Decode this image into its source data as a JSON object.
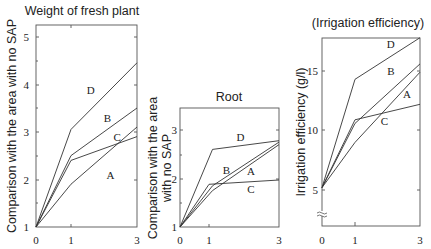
{
  "chart_data": [
    {
      "type": "line",
      "title": "Weight of fresh plant",
      "xlabel": "",
      "ylabel": "Comparison with the area with no SAP",
      "x": [
        0,
        1,
        3
      ],
      "x_ticks": [
        0,
        1,
        3
      ],
      "y_ticks": [
        1,
        2,
        3,
        4,
        5
      ],
      "ylim": [
        1,
        5.25
      ],
      "xlim": [
        0,
        3
      ],
      "grid": false,
      "legend": "inline labels",
      "series": [
        {
          "name": "A",
          "values": [
            1.0,
            1.9,
            3.1
          ],
          "label_pos": [
            2.2,
            2.0
          ]
        },
        {
          "name": "B",
          "values": [
            1.0,
            2.5,
            3.5
          ],
          "label_pos": [
            2.1,
            3.2
          ]
        },
        {
          "name": "C",
          "values": [
            1.0,
            2.4,
            2.9
          ],
          "label_pos": [
            2.4,
            2.8
          ]
        },
        {
          "name": "D",
          "values": [
            1.0,
            3.05,
            4.45
          ],
          "label_pos": [
            1.6,
            3.8
          ]
        }
      ]
    },
    {
      "type": "line",
      "title": "Root",
      "xlabel": "",
      "ylabel_lines": [
        "Comparison with the area",
        "with no SAP"
      ],
      "ylabel": "Comparison with the area with no SAP",
      "x": [
        0,
        1,
        3
      ],
      "x_ticks": [
        0,
        1,
        3
      ],
      "y_ticks": [
        1,
        2,
        3
      ],
      "ylim": [
        1,
        3.45
      ],
      "xlim": [
        0,
        3
      ],
      "grid": false,
      "legend": "inline labels",
      "series": [
        {
          "name": "A",
          "values": [
            1.0,
            1.88,
            1.97
          ],
          "label_pos": [
            2.2,
            2.08
          ],
          "x": [
            0,
            1,
            3
          ]
        },
        {
          "name": "B",
          "values": [
            1.0,
            1.85,
            2.75
          ],
          "label_pos": [
            1.5,
            2.1
          ],
          "x": [
            0,
            1.1,
            3
          ]
        },
        {
          "name": "C",
          "values": [
            1.0,
            1.75,
            2.7
          ],
          "label_pos": [
            2.2,
            1.7
          ],
          "x": [
            0,
            1.1,
            3
          ]
        },
        {
          "name": "D",
          "values": [
            1.0,
            2.6,
            2.78
          ],
          "label_pos": [
            1.9,
            2.78
          ],
          "x": [
            0,
            1.1,
            3
          ]
        }
      ]
    },
    {
      "type": "line",
      "title": "(Irrigation efficiency)",
      "xlabel": "",
      "ylabel": "Irrigation efficiency (g/l)",
      "x": [
        0,
        1,
        3
      ],
      "x_ticks": [
        0,
        1,
        3
      ],
      "y_ticks": [
        5,
        10,
        15
      ],
      "ylim": [
        2,
        17.8
      ],
      "xlim": [
        0,
        3
      ],
      "axis_break": true,
      "grid": false,
      "legend": "inline labels",
      "series": [
        {
          "name": "A",
          "values": [
            5.2,
            10.9,
            12.2
          ],
          "label_pos": [
            2.6,
            12.7
          ]
        },
        {
          "name": "B",
          "values": [
            5.2,
            10.6,
            15.6
          ],
          "label_pos": [
            2.1,
            14.7
          ]
        },
        {
          "name": "C",
          "values": [
            5.2,
            9.0,
            14.9
          ],
          "label_pos": [
            1.9,
            10.5
          ]
        },
        {
          "name": "D",
          "values": [
            5.2,
            14.3,
            17.8
          ],
          "label_pos": [
            2.1,
            16.9
          ]
        }
      ]
    }
  ],
  "panels": [
    {
      "title": "Weight of fresh plant",
      "ylabel": "Comparison with the area with no SAP",
      "x_tick_labels": [
        "0",
        "1",
        "3"
      ],
      "y_tick_labels": [
        "1",
        "2",
        "3",
        "4",
        "5"
      ],
      "series_labels": [
        "A",
        "B",
        "C",
        "D"
      ]
    },
    {
      "title": "Root",
      "ylabel_line1": "Comparison with the area",
      "ylabel_line2": "with no SAP",
      "x_tick_labels": [
        "0",
        "1",
        "3"
      ],
      "y_tick_labels": [
        "1",
        "2",
        "3"
      ],
      "series_labels": [
        "A",
        "B",
        "C",
        "D"
      ]
    },
    {
      "title": "(Irrigation efficiency)",
      "ylabel": "Irrigation efficiency (g/l)",
      "x_tick_labels": [
        "0",
        "1",
        "3"
      ],
      "y_tick_labels": [
        "5",
        "10",
        "15"
      ],
      "series_labels": [
        "A",
        "B",
        "C",
        "D"
      ]
    }
  ]
}
